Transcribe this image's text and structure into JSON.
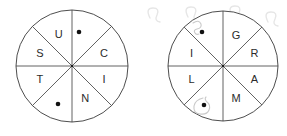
{
  "canvas": {
    "width": 287,
    "height": 136,
    "background": "#ffffff"
  },
  "style": {
    "stroke_color": "#3a3a3a",
    "label_color": "#2b2b2b",
    "pip_color": "#111111",
    "scribble_color": "#c9c9c9",
    "watermark_color": "#e6e6e6"
  },
  "wheels": [
    {
      "name": "left-wheel",
      "center": {
        "x": 72,
        "y": 66
      },
      "radius": 56,
      "sector_count": 8,
      "sectors": [
        {
          "index": 0,
          "start_deg": 0,
          "end_deg": 45,
          "label": "",
          "marker": "dot"
        },
        {
          "index": 1,
          "start_deg": 45,
          "end_deg": 90,
          "label": "C",
          "marker": "none"
        },
        {
          "index": 2,
          "start_deg": 90,
          "end_deg": 135,
          "label": "I",
          "marker": "none"
        },
        {
          "index": 3,
          "start_deg": 135,
          "end_deg": 180,
          "label": "N",
          "marker": "none"
        },
        {
          "index": 4,
          "start_deg": 180,
          "end_deg": 225,
          "label": "",
          "marker": "dot"
        },
        {
          "index": 5,
          "start_deg": 225,
          "end_deg": 270,
          "label": "T",
          "marker": "none"
        },
        {
          "index": 6,
          "start_deg": 270,
          "end_deg": 315,
          "label": "S",
          "marker": "none"
        },
        {
          "index": 7,
          "start_deg": 315,
          "end_deg": 360,
          "label": "U",
          "marker": "none"
        }
      ],
      "letters_clockwise_from_top": [
        "",
        "C",
        "I",
        "N",
        "",
        "T",
        "S",
        "U"
      ],
      "dots": [
        {
          "x": 79,
          "y": 32
        },
        {
          "x": 58,
          "y": 104
        }
      ]
    },
    {
      "name": "right-wheel",
      "center": {
        "x": 223,
        "y": 66
      },
      "radius": 55,
      "sector_count": 8,
      "sectors": [
        {
          "index": 0,
          "start_deg": 0,
          "end_deg": 45,
          "label": "G",
          "marker": "none"
        },
        {
          "index": 1,
          "start_deg": 45,
          "end_deg": 90,
          "label": "R",
          "marker": "none"
        },
        {
          "index": 2,
          "start_deg": 90,
          "end_deg": 135,
          "label": "A",
          "marker": "none"
        },
        {
          "index": 3,
          "start_deg": 135,
          "end_deg": 180,
          "label": "M",
          "marker": "none"
        },
        {
          "index": 4,
          "start_deg": 180,
          "end_deg": 225,
          "label": "",
          "marker": "dot"
        },
        {
          "index": 5,
          "start_deg": 225,
          "end_deg": 270,
          "label": "L",
          "marker": "none"
        },
        {
          "index": 6,
          "start_deg": 270,
          "end_deg": 315,
          "label": "I",
          "marker": "none"
        },
        {
          "index": 7,
          "start_deg": 315,
          "end_deg": 360,
          "label": "",
          "marker": "dot"
        }
      ],
      "letters_clockwise_from_top": [
        "G",
        "R",
        "A",
        "M",
        "",
        "L",
        "I",
        ""
      ],
      "dots": [
        {
          "x": 202,
          "y": 32
        },
        {
          "x": 204,
          "y": 105
        }
      ]
    }
  ],
  "annotations": [
    {
      "name": "scribble-hook-upper",
      "near_wheel": "right-wheel",
      "description": "faint hand-drawn hook above upper-left dot"
    },
    {
      "name": "scribble-loop-lower",
      "near_wheel": "right-wheel",
      "description": "faint hand-drawn loop encircling lower-left dot"
    }
  ],
  "watermarks": [
    {
      "name": "watermark-mark-1",
      "x": 150,
      "y": 8
    },
    {
      "name": "watermark-mark-2",
      "x": 188,
      "y": 7
    },
    {
      "name": "watermark-mark-3",
      "x": 232,
      "y": 6
    },
    {
      "name": "watermark-mark-4",
      "x": 268,
      "y": 12
    }
  ]
}
